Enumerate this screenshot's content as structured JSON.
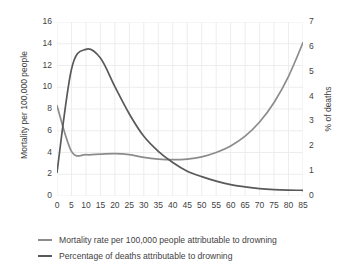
{
  "chart_data": {
    "type": "line",
    "title": "",
    "xlabel": "",
    "ylabel": "Mortality per 100,000 people",
    "ylabel_right": "% of deaths",
    "x": [
      0,
      5,
      10,
      15,
      20,
      25,
      30,
      35,
      40,
      45,
      50,
      55,
      60,
      65,
      70,
      75,
      80,
      85
    ],
    "xlim": [
      0,
      85
    ],
    "ylim": [
      0,
      16
    ],
    "ylim_right": [
      0,
      7
    ],
    "xticks": [
      "0",
      "5",
      "10",
      "15",
      "20",
      "25",
      "30",
      "35",
      "40",
      "45",
      "50",
      "55",
      "60",
      "65",
      "70",
      "75",
      "80",
      "85"
    ],
    "yticks_left": [
      "0",
      "2",
      "4",
      "6",
      "8",
      "10",
      "12",
      "14",
      "16"
    ],
    "yticks_right": [
      "0",
      "1",
      "2",
      "3",
      "4",
      "5",
      "6",
      "7"
    ],
    "grid": true,
    "legend_position": "below",
    "series": [
      {
        "name": "Mortality rate per 100,000 people attributable to drowning",
        "axis": "left",
        "color": "#8c8c8c",
        "values": [
          8.3,
          4.1,
          3.8,
          3.85,
          3.9,
          3.8,
          3.55,
          3.4,
          3.35,
          3.4,
          3.6,
          4.0,
          4.6,
          5.5,
          6.8,
          8.6,
          11.0,
          14.1
        ]
      },
      {
        "name": "Percentage of deaths attributable to drowning",
        "axis": "right",
        "color": "#58595b",
        "values": [
          0.95,
          5.1,
          5.9,
          5.55,
          4.4,
          3.3,
          2.4,
          1.8,
          1.35,
          1.0,
          0.78,
          0.6,
          0.46,
          0.37,
          0.3,
          0.26,
          0.24,
          0.23
        ]
      }
    ]
  },
  "legend": {
    "items": [
      {
        "label": "Mortality rate per 100,000 people attributable to drowning",
        "color": "#8c8c8c"
      },
      {
        "label": "Percentage of deaths attributable to drowning",
        "color": "#58595b"
      }
    ]
  },
  "colors": {
    "grid": "#ededed",
    "text": "#3f3f3f",
    "background": "#ffffff"
  }
}
